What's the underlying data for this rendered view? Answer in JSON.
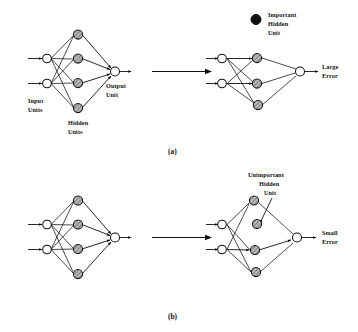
{
  "figure": {
    "title_visible": false,
    "background": "#ffffff",
    "ink_color": "#101010",
    "panels": [
      {
        "id": "a",
        "caption": "(a)",
        "labels": {
          "input_units": "Input\nUnits",
          "input_units_line1": "Input",
          "input_units_line2": "Units",
          "hidden_units_line1": "Hidden",
          "hidden_units_line2": "Units",
          "output_unit_line1": "Output",
          "output_unit_line2": "Unit",
          "legend_line1": "Important",
          "legend_line2": "Hidden",
          "legend_line3": "Unit",
          "result_line1": "Large",
          "result_line2": "Error"
        },
        "left_network": {
          "name": "full-network-a",
          "input_units": 2,
          "hidden_units": 4,
          "output_units": 1,
          "hidden_style": "hatched-gray"
        },
        "right_network": {
          "name": "pruned-network-a",
          "input_units": 2,
          "hidden_units": 3,
          "output_units": 1,
          "hidden_style": "hatched-gray",
          "note": "one important hidden unit removed"
        },
        "legend_marker": "solid-black-circle"
      },
      {
        "id": "b",
        "caption": "(b)",
        "labels": {
          "legend_line1": "Unimportant",
          "legend_line2": "Hidden",
          "legend_line3": "Unit",
          "result_line1": "Small",
          "result_line2": "Error"
        },
        "left_network": {
          "name": "full-network-b",
          "input_units": 2,
          "hidden_units": 4,
          "output_units": 1,
          "hidden_style": "hatched-gray"
        },
        "right_network": {
          "name": "pruned-network-b",
          "input_units": 2,
          "hidden_units": 4,
          "output_units": 1,
          "hidden_style": "hatched-gray",
          "note": "unimportant hidden unit disconnected, pointed at by arrow"
        }
      }
    ]
  },
  "colors": {
    "ink": "#101010",
    "hidden_fill_light": "#b9b9b9",
    "hidden_fill_dark": "#6e6e6e",
    "node_open_fill": "#ffffff",
    "legend_solid": "#101010",
    "background": "#ffffff"
  }
}
